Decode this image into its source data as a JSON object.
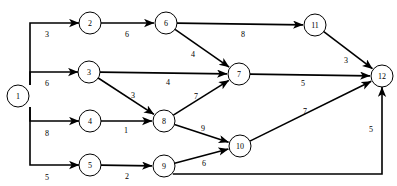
{
  "diagram": {
    "type": "directed-weighted-graph",
    "title": "",
    "background_color": "#ffffff",
    "stroke_color": "#000000",
    "node_fill": "#ffffff",
    "node_radius": 11,
    "nodes": [
      {
        "id": "1",
        "label": "1",
        "x": 18,
        "y": 96,
        "r": 11
      },
      {
        "id": "2",
        "label": "2",
        "x": 90,
        "y": 23,
        "r": 11
      },
      {
        "id": "3",
        "label": "3",
        "x": 89,
        "y": 72,
        "r": 11
      },
      {
        "id": "4",
        "label": "4",
        "x": 90,
        "y": 121,
        "r": 11
      },
      {
        "id": "5",
        "label": "5",
        "x": 90,
        "y": 165,
        "r": 11
      },
      {
        "id": "6",
        "label": "6",
        "x": 166,
        "y": 23,
        "r": 11
      },
      {
        "id": "7",
        "label": "7",
        "x": 239,
        "y": 74,
        "r": 11
      },
      {
        "id": "8",
        "label": "8",
        "x": 164,
        "y": 121,
        "r": 11
      },
      {
        "id": "9",
        "label": "9",
        "x": 164,
        "y": 166,
        "r": 11
      },
      {
        "id": "10",
        "label": "10",
        "x": 240,
        "y": 146,
        "r": 11
      },
      {
        "id": "11",
        "label": "11",
        "x": 315,
        "y": 25,
        "r": 11
      },
      {
        "id": "12",
        "label": "12",
        "x": 382,
        "y": 76,
        "r": 11
      }
    ],
    "edges": [
      {
        "from": "1",
        "to": "2",
        "weight": "3",
        "label_x": 47,
        "label_y": 34
      },
      {
        "from": "1",
        "to": "3",
        "weight": "6",
        "label_x": 47,
        "label_y": 83
      },
      {
        "from": "1",
        "to": "4",
        "weight": "8",
        "label_x": 47,
        "label_y": 133
      },
      {
        "from": "1",
        "to": "5",
        "weight": "5",
        "label_x": 47,
        "label_y": 177
      },
      {
        "from": "2",
        "to": "6",
        "weight": "6",
        "label_x": 127,
        "label_y": 34
      },
      {
        "from": "6",
        "to": "11",
        "weight": "8",
        "label_x": 243,
        "label_y": 34
      },
      {
        "from": "6",
        "to": "7",
        "weight": "4",
        "label_x": 193,
        "label_y": 54
      },
      {
        "from": "3",
        "to": "7",
        "weight": "4",
        "label_x": 168,
        "label_y": 82
      },
      {
        "from": "3",
        "to": "8",
        "weight": "3",
        "label_x": 133,
        "label_y": 95
      },
      {
        "from": "4",
        "to": "8",
        "weight": "1",
        "label_x": 126,
        "label_y": 130
      },
      {
        "from": "8",
        "to": "7",
        "weight": "7",
        "label_x": 196,
        "label_y": 96
      },
      {
        "from": "8",
        "to": "10",
        "weight": "9",
        "label_x": 203,
        "label_y": 128
      },
      {
        "from": "5",
        "to": "9",
        "weight": "2",
        "label_x": 127,
        "label_y": 176
      },
      {
        "from": "9",
        "to": "10",
        "weight": "6",
        "label_x": 204,
        "label_y": 163
      },
      {
        "from": "11",
        "to": "12",
        "weight": "3",
        "label_x": 346,
        "label_y": 60
      },
      {
        "from": "7",
        "to": "12",
        "weight": "5",
        "label_x": 303,
        "label_y": 83
      },
      {
        "from": "10",
        "to": "12",
        "weight": "7",
        "label_x": 305,
        "label_y": 111
      },
      {
        "from": "9",
        "to": "12",
        "weight": "5",
        "label_x": 371,
        "label_y": 129
      }
    ]
  }
}
